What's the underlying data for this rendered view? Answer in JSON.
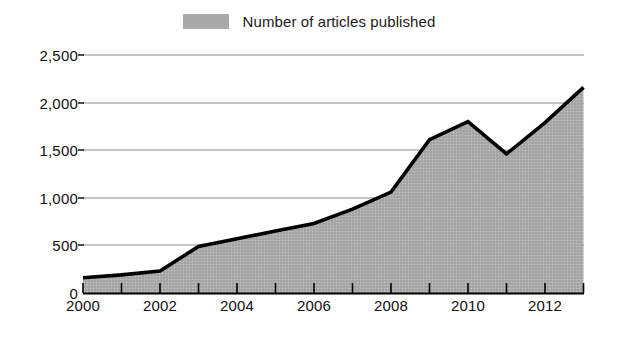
{
  "chart_data": {
    "type": "area",
    "title": "",
    "subtitle": "",
    "xlabel": "",
    "ylabel": "",
    "x": [
      2000,
      2001,
      2002,
      2003,
      2004,
      2005,
      2006,
      2007,
      2008,
      2009,
      2010,
      2011,
      2012,
      2013
    ],
    "categories": [
      "2000",
      "2001",
      "2002",
      "2003",
      "2004",
      "2005",
      "2006",
      "2007",
      "2008",
      "2009",
      "2010",
      "2011",
      "2012",
      "2013"
    ],
    "series": [
      {
        "name": "Number of articles published",
        "values": [
          160,
          190,
          230,
          490,
          570,
          650,
          730,
          880,
          1060,
          1610,
          1800,
          1460,
          1790,
          2160
        ],
        "fill_color": "#a9a9a9",
        "line_color": "#000000"
      }
    ],
    "ylim": [
      0,
      2500
    ],
    "xlim": [
      2000,
      2013
    ],
    "ytick_values": [
      0,
      500,
      1000,
      1500,
      2000,
      2500
    ],
    "ytick_labels": [
      "0",
      "500",
      "1,000",
      "1,500",
      "2,000",
      "2,500"
    ],
    "xtick_values": [
      2000,
      2001,
      2002,
      2003,
      2004,
      2005,
      2006,
      2007,
      2008,
      2009,
      2010,
      2011,
      2012,
      2013
    ],
    "xtick_labels_shown": [
      "2000",
      "2002",
      "2004",
      "2006",
      "2008",
      "2010",
      "2012"
    ],
    "xtick_label_values": [
      2000,
      2002,
      2004,
      2006,
      2008,
      2010,
      2012
    ],
    "grid": "horizontal",
    "grid_color": "#8c8c8c",
    "legend_position": "top-center",
    "legend_entries": [
      "Number of articles published"
    ]
  },
  "legend": {
    "label": "Number of articles published",
    "swatch_color": "#a9a9a9"
  },
  "axes": {
    "y_labels": [
      "2,500",
      "2,000",
      "1,500",
      "1,000",
      "500",
      "0"
    ],
    "x_labels": [
      "2000",
      "2002",
      "2004",
      "2006",
      "2008",
      "2010",
      "2012"
    ]
  },
  "colors": {
    "background": "#ffffff",
    "area_fill": "#a9a9a9",
    "line": "#000000",
    "gridline": "#8c8c8c",
    "axis": "#000000",
    "text": "#101010"
  }
}
